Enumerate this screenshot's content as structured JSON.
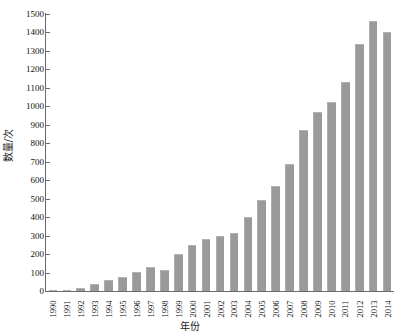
{
  "chart_data": {
    "type": "bar",
    "title": "",
    "xlabel": "年份",
    "ylabel": "数量/次",
    "ylim": [
      0,
      1500
    ],
    "ytick_step": 100,
    "grid": false,
    "legend": "none",
    "bar_color": "#9a9a9a",
    "axis_color": "#6b6b6b",
    "categories": [
      "1990",
      "1991",
      "1992",
      "1993",
      "1994",
      "1995",
      "1996",
      "1997",
      "1998",
      "1999",
      "2000",
      "2001",
      "2002",
      "2003",
      "2004",
      "2005",
      "2006",
      "2007",
      "2008",
      "2009",
      "2010",
      "2011",
      "2012",
      "2013",
      "2014"
    ],
    "values": [
      5,
      6,
      18,
      36,
      58,
      75,
      102,
      131,
      113,
      201,
      250,
      279,
      298,
      313,
      400,
      492,
      570,
      686,
      870,
      968,
      1025,
      1130,
      1340,
      1460,
      1400
    ],
    "ytick_labels": [
      "0",
      "100",
      "200",
      "300",
      "400",
      "500",
      "600",
      "700",
      "800",
      "900",
      "1000",
      "1100",
      "1200",
      "1300",
      "1400",
      "1500"
    ],
    "ytick_values": [
      0,
      100,
      200,
      300,
      400,
      500,
      600,
      700,
      800,
      900,
      1000,
      1100,
      1200,
      1300,
      1400,
      1500
    ]
  }
}
